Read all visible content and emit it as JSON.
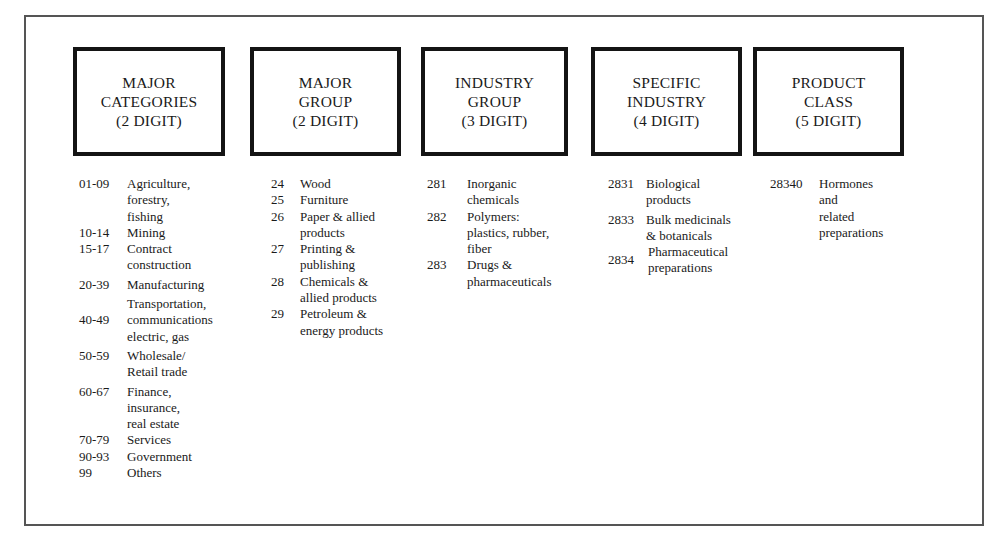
{
  "columns": [
    {
      "header": [
        "MAJOR",
        "CATEGORIES",
        "(2 DIGIT)"
      ],
      "items": [
        {
          "code": "01-09",
          "desc": "Agriculture,\nforestry,\nfishing"
        },
        {
          "code": "10-14",
          "desc": "Mining"
        },
        {
          "code": "15-17",
          "desc": "Contract\nconstruction"
        },
        {
          "code": "20-39",
          "desc": "Manufacturing"
        },
        {
          "code": "40-49",
          "desc": "Transportation,\ncommunications\nelectric, gas"
        },
        {
          "code": "50-59",
          "desc": "Wholesale/\nRetail trade"
        },
        {
          "code": "60-67",
          "desc": "Finance,\ninsurance,\nreal estate"
        },
        {
          "code": "70-79",
          "desc": "Services"
        },
        {
          "code": "90-93",
          "desc": "Government"
        },
        {
          "code": "99",
          "desc": "Others"
        }
      ]
    },
    {
      "header": [
        "MAJOR",
        "GROUP",
        "(2 DIGIT)"
      ],
      "items": [
        {
          "code": "24",
          "desc": "Wood"
        },
        {
          "code": "25",
          "desc": "Furniture"
        },
        {
          "code": "26",
          "desc": "Paper & allied\nproducts"
        },
        {
          "code": "27",
          "desc": "Printing &\npublishing"
        },
        {
          "code": "28",
          "desc": "Chemicals &\nallied products"
        },
        {
          "code": "29",
          "desc": "Petroleum &\nenergy products"
        }
      ]
    },
    {
      "header": [
        "INDUSTRY",
        "GROUP",
        "(3 DIGIT)"
      ],
      "items": [
        {
          "code": "281",
          "desc": "Inorganic\nchemicals"
        },
        {
          "code": "282",
          "desc": "Polymers:\nplastics, rubber,\nfiber"
        },
        {
          "code": "283",
          "desc": "Drugs &\npharmaceuticals"
        }
      ]
    },
    {
      "header": [
        "SPECIFIC",
        "INDUSTRY",
        "(4 DIGIT)"
      ],
      "items": [
        {
          "code": "2831",
          "desc": "Biological\nproducts"
        },
        {
          "code": "2833",
          "desc": "Bulk medicinals\n& botanicals"
        },
        {
          "code": "2834",
          "desc": "Pharmaceutical\npreparations"
        }
      ]
    },
    {
      "header": [
        "PRODUCT",
        "CLASS",
        "(5 DIGIT)"
      ],
      "items": [
        {
          "code": "28340",
          "desc": "Hormones\nand\nrelated\npreparations"
        }
      ]
    }
  ]
}
